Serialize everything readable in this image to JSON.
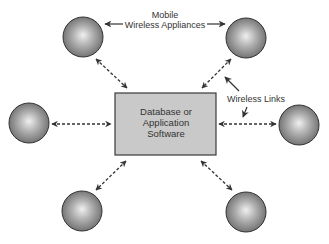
{
  "diagram": {
    "center_box": {
      "lines": [
        "Database or",
        "Application",
        "Software"
      ],
      "fill": "#c9c9c9",
      "stroke": "#3a3a3a"
    },
    "nodes": [
      {
        "id": "top-left",
        "cx": 83,
        "cy": 37
      },
      {
        "id": "top-right",
        "cx": 246,
        "cy": 38
      },
      {
        "id": "left",
        "cx": 29,
        "cy": 123
      },
      {
        "id": "right",
        "cx": 299,
        "cy": 125
      },
      {
        "id": "bottom-left",
        "cx": 82,
        "cy": 211
      },
      {
        "id": "bottom-right",
        "cx": 246,
        "cy": 212
      }
    ],
    "annotations": {
      "appliances_label": [
        "Mobile",
        "Wireless Appliances"
      ],
      "links_label": "Wireless Links"
    },
    "colors": {
      "sphere_highlight": "#eeeeee",
      "sphere_mid": "#a8a8a8",
      "sphere_edge": "#6a6a6a",
      "sphere_outline": "#333333",
      "arrow": "#333333"
    }
  }
}
